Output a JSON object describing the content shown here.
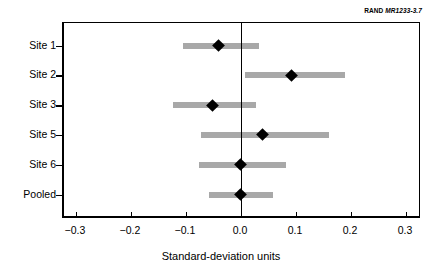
{
  "source": {
    "org": "RAND",
    "code": "MR1233-3.7"
  },
  "chart_data": {
    "type": "scatter",
    "title": "",
    "subtitle": "",
    "xlabel": "Standard-deviation units",
    "ylabel": "",
    "xlim": [
      -0.3236,
      0.3273
    ],
    "xticks": [
      -0.3,
      -0.2,
      -0.1,
      0.0,
      0.1,
      0.2,
      0.3
    ],
    "xticklabels": [
      "−0.3",
      "−0.2",
      "−0.1",
      "0.0",
      "0.1",
      "0.2",
      "0.3"
    ],
    "grid": false,
    "legend": null,
    "reference_line": 0.0,
    "categories": [
      "Site 1",
      "Site 2",
      "Site 3",
      "Site 5",
      "Site 6",
      "Pooled"
    ],
    "values": [
      -0.04,
      0.091,
      -0.051,
      0.04,
      0.0,
      0.0
    ],
    "ci_low": [
      -0.105,
      0.007,
      -0.124,
      -0.073,
      -0.076,
      -0.058
    ],
    "ci_high": [
      0.033,
      0.189,
      0.027,
      0.16,
      0.082,
      0.058
    ],
    "points": [
      {
        "label": "Site 1",
        "value": -0.04,
        "ci_low": -0.105,
        "ci_high": 0.033
      },
      {
        "label": "Site 2",
        "value": 0.091,
        "ci_low": 0.007,
        "ci_high": 0.189
      },
      {
        "label": "Site 3",
        "value": -0.051,
        "ci_low": -0.124,
        "ci_high": 0.027
      },
      {
        "label": "Site 5",
        "value": 0.04,
        "ci_low": -0.073,
        "ci_high": 0.16
      },
      {
        "label": "Site 6",
        "value": 0.0,
        "ci_low": -0.076,
        "ci_high": 0.082
      },
      {
        "label": "Pooled",
        "value": 0.0,
        "ci_low": -0.058,
        "ci_high": 0.058
      }
    ],
    "colors": {
      "interval_bar": "#a8a8a8",
      "point_marker": "#000000",
      "axis": "#000000",
      "background": "#ffffff"
    }
  }
}
